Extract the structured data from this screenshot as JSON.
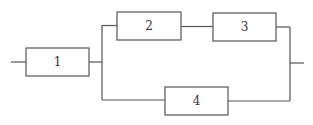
{
  "diagram": {
    "type": "reliability-block-diagram",
    "stroke_color": "#555555",
    "background": "#ffffff",
    "blocks": [
      {
        "id": "1",
        "label": "1",
        "x": 26,
        "y": 48,
        "w": 63,
        "h": 28
      },
      {
        "id": "2",
        "label": "2",
        "x": 117,
        "y": 12,
        "w": 64,
        "h": 28
      },
      {
        "id": "3",
        "label": "3",
        "x": 213,
        "y": 13,
        "w": 63,
        "h": 28
      },
      {
        "id": "4",
        "label": "4",
        "x": 165,
        "y": 87,
        "w": 63,
        "h": 28
      }
    ],
    "connections": [
      {
        "from": "input",
        "to": "1"
      },
      {
        "from": "1",
        "to": "2"
      },
      {
        "from": "2",
        "to": "3"
      },
      {
        "from": "1",
        "to": "4"
      },
      {
        "from": "3",
        "to": "output"
      },
      {
        "from": "4",
        "to": "output"
      }
    ]
  }
}
